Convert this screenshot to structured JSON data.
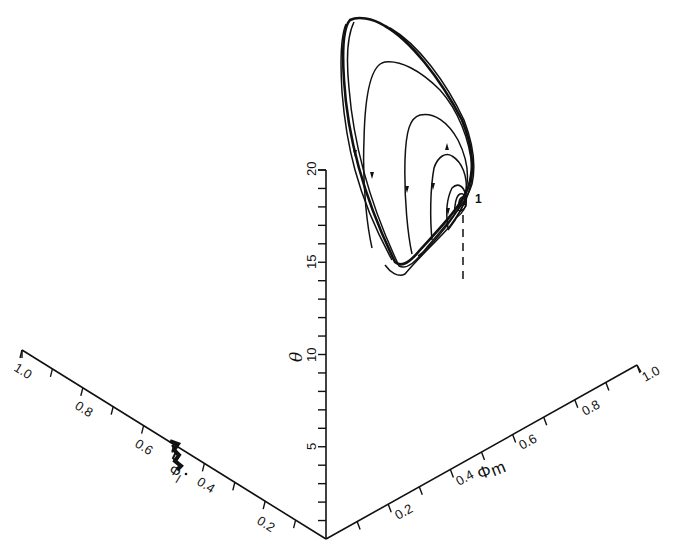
{
  "figure": {
    "fixed_point_label": "1"
  },
  "axes": {
    "theta": {
      "label": "θ",
      "tick_labels": [
        "5",
        "10",
        "15",
        "20"
      ],
      "range": [
        0,
        20
      ]
    },
    "phi_l": {
      "label": "Φ",
      "subscript": "l",
      "tick_labels": [
        "0.2",
        "0.4",
        "0.6",
        "0.8",
        "1.0"
      ],
      "range": [
        0,
        1.0
      ]
    },
    "phi_m": {
      "label": "Φ",
      "subscript": "m",
      "tick_labels": [
        "0.2",
        "0.4",
        "0.6",
        "0.8",
        "1.0"
      ],
      "range": [
        0,
        1.0
      ]
    }
  },
  "chart_data": {
    "type": "line",
    "title": "",
    "projection": "3d-oblique",
    "axes": [
      "Phi_l",
      "Phi_m",
      "theta"
    ],
    "axis_ranges": {
      "Phi_l": [
        0,
        1.0
      ],
      "Phi_m": [
        0,
        1.0
      ],
      "theta": [
        0,
        20
      ]
    },
    "ticks": {
      "theta": [
        5,
        10,
        15,
        20
      ],
      "Phi_l": [
        0.2,
        0.4,
        0.6,
        0.8,
        1.0
      ],
      "Phi_m": [
        0.2,
        0.4,
        0.6,
        0.8,
        1.0
      ]
    },
    "series": [
      {
        "name": "trajectory",
        "style": "spiral converging to fixed point 1 (multiple decreasing loops)",
        "approx_theta_range": [
          14.5,
          26
        ],
        "fixed_point_theta_approx": 18
      },
      {
        "name": "projection on Phi_l plane",
        "style": "dense short dark segment near Phi_l ≈ 0.45–0.5"
      }
    ],
    "annotations": [
      "1 (fixed point)",
      "dashed vertical drop line from fixed point"
    ],
    "grid": false,
    "legend": null
  }
}
